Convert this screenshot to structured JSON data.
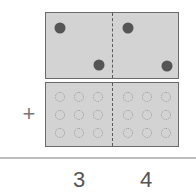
{
  "diagram": {
    "top_frame": {
      "left_cell_dots": [
        {
          "x": 14,
          "y": 15
        },
        {
          "x": 53,
          "y": 52
        }
      ],
      "right_cell_dots": [
        {
          "x": 82,
          "y": 15
        },
        {
          "x": 121,
          "y": 53
        }
      ]
    },
    "bottom_frame": {
      "rows": 3,
      "cols_per_side": 3,
      "empty_circles": true
    },
    "operator": "+",
    "sum_digits": [
      "3",
      "4"
    ],
    "colors": {
      "frame_fill": "#d3d3d3",
      "frame_border": "#6a6a6a",
      "dot": "#555555",
      "empty_circle": "#9a9a9a",
      "text": "#555555"
    }
  }
}
